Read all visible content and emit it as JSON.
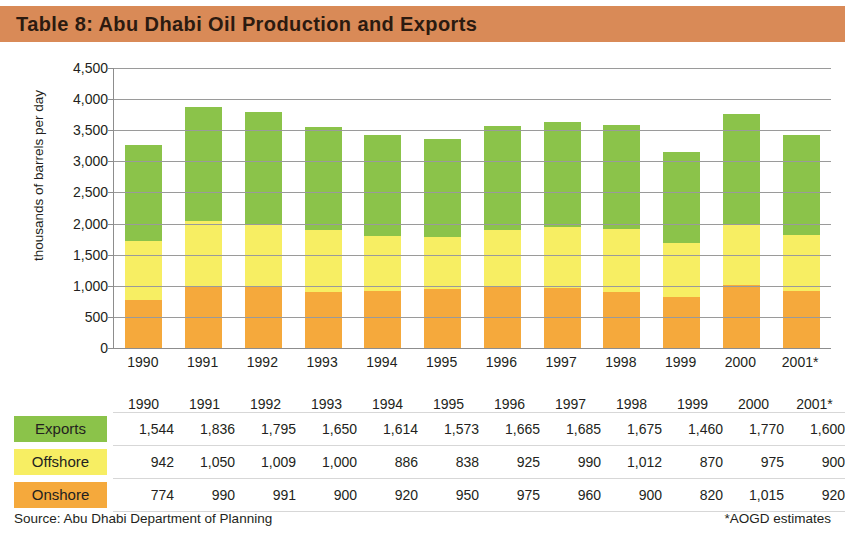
{
  "header": {
    "title": "Table 8: Abu Dhabi Oil Production and Exports",
    "band_color": "#d98a57"
  },
  "footer": {
    "source": "Source: Abu Dhabi Department of Planning",
    "note": "*AOGD estimates"
  },
  "legend": {
    "exports": "Exports",
    "offshore": "Offshore",
    "onshore": "Onshore"
  },
  "colors": {
    "exports": "#8bc34a",
    "offshore": "#f7ee63",
    "onshore": "#f5a93c",
    "gridline": "#9a9a9a",
    "axis": "#8d8d8d"
  },
  "chart_data": {
    "type": "bar",
    "stacked": true,
    "title": "Table 8: Abu Dhabi Oil Production and Exports",
    "xlabel": "",
    "ylabel": "thousands of barrels per day",
    "ylim": [
      0,
      4500
    ],
    "ytick_step": 500,
    "yticks": [
      "0",
      "500",
      "1,000",
      "1,500",
      "2,000",
      "2,500",
      "3,000",
      "3,500",
      "4,000",
      "4,500"
    ],
    "grid": true,
    "legend_position": "table-row-labels",
    "categories": [
      "1990",
      "1991",
      "1992",
      "1993",
      "1994",
      "1995",
      "1996",
      "1997",
      "1998",
      "1999",
      "2000",
      "2001*"
    ],
    "series": [
      {
        "name": "Onshore",
        "color": "#f5a93c",
        "values": [
          774,
          990,
          991,
          900,
          920,
          950,
          975,
          960,
          900,
          820,
          1015,
          920
        ],
        "labels": [
          "774",
          "990",
          "991",
          "900",
          "920",
          "950",
          "975",
          "960",
          "900",
          "820",
          "1,015",
          "920"
        ]
      },
      {
        "name": "Offshore",
        "color": "#f7ee63",
        "values": [
          942,
          1050,
          1009,
          1000,
          886,
          838,
          925,
          990,
          1012,
          870,
          975,
          900
        ],
        "labels": [
          "942",
          "1,050",
          "1,009",
          "1,000",
          "886",
          "838",
          "925",
          "990",
          "1,012",
          "870",
          "975",
          "900"
        ]
      },
      {
        "name": "Exports",
        "color": "#8bc34a",
        "values": [
          1544,
          1836,
          1795,
          1650,
          1614,
          1573,
          1665,
          1685,
          1675,
          1460,
          1770,
          1600
        ],
        "labels": [
          "1,544",
          "1,836",
          "1,795",
          "1,650",
          "1,614",
          "1,573",
          "1,665",
          "1,685",
          "1,675",
          "1,460",
          "1,770",
          "1,600"
        ]
      }
    ]
  }
}
